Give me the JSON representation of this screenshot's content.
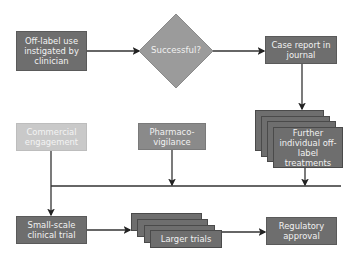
{
  "diagram": {
    "type": "flowchart",
    "nodes": {
      "offlabel": {
        "label": "Off-label use instigated by clinician",
        "shape": "rectangle",
        "color": "#6e6e6e"
      },
      "successful": {
        "label": "Successful?",
        "shape": "diamond",
        "color": "#9b9b9b"
      },
      "case_report": {
        "label": "Case report in journal",
        "shape": "rectangle",
        "color": "#6e6e6e"
      },
      "further": {
        "label": "Further individual off-label treatments",
        "shape": "stacked-rectangles",
        "color": "#6e6e6e"
      },
      "commercial": {
        "label": "Commercial engagement",
        "shape": "rectangle",
        "color": "#c9c9c9"
      },
      "pharmaco": {
        "label": "Pharmaco-vigilance",
        "shape": "rectangle",
        "color": "#8a8a8a"
      },
      "small_trial": {
        "label": "Small-scale clinical trial",
        "shape": "rectangle",
        "color": "#6e6e6e"
      },
      "larger_trials": {
        "label": "Larger trials",
        "shape": "stacked-rectangles",
        "color": "#6e6e6e"
      },
      "regulatory": {
        "label": "Regulatory approval",
        "shape": "rectangle",
        "color": "#6e6e6e"
      }
    },
    "edges": [
      {
        "from": "offlabel",
        "to": "successful"
      },
      {
        "from": "successful",
        "to": "case_report"
      },
      {
        "from": "case_report",
        "to": "further"
      },
      {
        "from": "further",
        "to": "small_trial"
      },
      {
        "from": "pharmaco",
        "to": "small_trial"
      },
      {
        "from": "commercial",
        "to": "small_trial"
      },
      {
        "from": "small_trial",
        "to": "larger_trials"
      },
      {
        "from": "larger_trials",
        "to": "regulatory"
      }
    ]
  }
}
